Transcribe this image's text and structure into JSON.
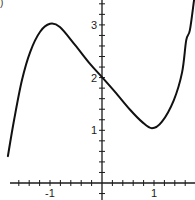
{
  "chart_data": {
    "type": "line",
    "title": "",
    "panel_label": ")",
    "xlabel": "",
    "ylabel": "",
    "xlim": [
      -1.96,
      1.8
    ],
    "ylim": [
      -0.33,
      3.47
    ],
    "grid": false,
    "axis_color": "#1a1a1a",
    "line_color": "#111111",
    "x_minor_tick_step": 0.2,
    "y_minor_tick_step": 0.2,
    "x_tick_labels": [
      {
        "value": -1,
        "label": "-1"
      },
      {
        "value": 1,
        "label": "1"
      }
    ],
    "y_tick_labels": [
      {
        "value": 1,
        "label": "1"
      },
      {
        "value": 2,
        "label": "2"
      },
      {
        "value": 3,
        "label": "3"
      }
    ],
    "series": [
      {
        "name": "f(x)",
        "x": [
          -1.81,
          -1.69,
          -1.54,
          -1.38,
          -1.19,
          -1.0,
          -0.81,
          -0.52,
          -0.23,
          0.0,
          0.25,
          0.54,
          0.77,
          0.96,
          1.15,
          1.38,
          1.54,
          1.62,
          1.69,
          1.77
        ],
        "y": [
          0.51,
          1.2,
          1.95,
          2.49,
          2.87,
          3.02,
          2.96,
          2.62,
          2.26,
          2.01,
          1.73,
          1.39,
          1.16,
          1.04,
          1.16,
          1.57,
          2.1,
          2.71,
          2.9,
          3.47
        ]
      }
    ],
    "annotations": [
      {
        "type": "local-max",
        "x": -1,
        "y": 3
      },
      {
        "type": "local-min",
        "x": 1,
        "y": 1
      },
      {
        "type": "y-intercept",
        "x": 0,
        "y": 2
      }
    ]
  }
}
